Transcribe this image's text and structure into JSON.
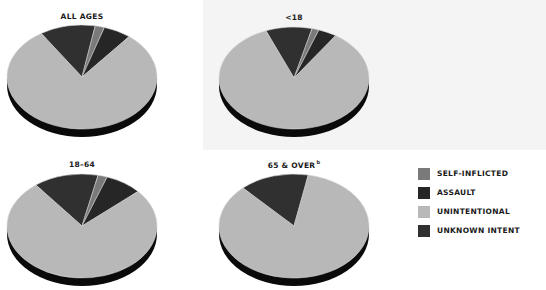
{
  "chart_data": {
    "type": "pie",
    "style": "3d-elliptical",
    "legend": {
      "position": "right",
      "entries": [
        {
          "key": "self_inflicted",
          "label": "SELF-INFLICTED",
          "color": "#7a7a7a"
        },
        {
          "key": "assault",
          "label": "ASSAULT",
          "color": "#262626"
        },
        {
          "key": "unintentional",
          "label": "UNINTENTIONAL",
          "color": "#b8b8b8"
        },
        {
          "key": "unknown_intent",
          "label": "UNKNOWN INTENT",
          "color": "#303030"
        }
      ]
    },
    "pies": [
      {
        "title": "ALL AGES",
        "superscript": "",
        "center": [
          82,
          77
        ],
        "rx": 75,
        "ry": 52,
        "depth": 8,
        "title_pos": [
          82,
          19
        ],
        "start_angle_deg": -33,
        "slices": [
          {
            "key": "unknown_intent",
            "percent": 12
          },
          {
            "key": "self_inflicted",
            "percent": 2
          },
          {
            "key": "assault",
            "percent": 6
          },
          {
            "key": "unintentional",
            "percent": 80
          }
        ]
      },
      {
        "title": "<18",
        "superscript": "",
        "center": [
          294,
          78
        ],
        "rx": 75,
        "ry": 51,
        "depth": 8,
        "title_pos": [
          294,
          20
        ],
        "start_angle_deg": -22,
        "slices": [
          {
            "key": "unknown_intent",
            "percent": 10
          },
          {
            "key": "self_inflicted",
            "percent": 1.5
          },
          {
            "key": "assault",
            "percent": 4
          },
          {
            "key": "unintentional",
            "percent": 84.5
          }
        ]
      },
      {
        "title": "18–64",
        "superscript": "",
        "center": [
          82,
          226
        ],
        "rx": 75,
        "ry": 52,
        "depth": 8,
        "title_pos": [
          82,
          167
        ],
        "start_angle_deg": -38,
        "slices": [
          {
            "key": "unknown_intent",
            "percent": 14
          },
          {
            "key": "self_inflicted",
            "percent": 2
          },
          {
            "key": "assault",
            "percent": 8
          },
          {
            "key": "unintentional",
            "percent": 76
          }
        ]
      },
      {
        "title": "65 & OVER",
        "superscript": "b",
        "center": [
          294,
          226
        ],
        "rx": 75,
        "ry": 52,
        "depth": 8,
        "title_pos": [
          294,
          166
        ],
        "start_angle_deg": -43,
        "slices": [
          {
            "key": "unknown_intent",
            "percent": 15
          },
          {
            "key": "self_inflicted",
            "percent": 0
          },
          {
            "key": "assault",
            "percent": 0
          },
          {
            "key": "unintentional",
            "percent": 85
          }
        ]
      }
    ]
  },
  "colors": {
    "background": "#ffffff",
    "panel": "#f4f4f4",
    "pie_base": "#0a0a0a",
    "slice_separator": "#d8d8d8",
    "text": "#1a1a1a"
  }
}
